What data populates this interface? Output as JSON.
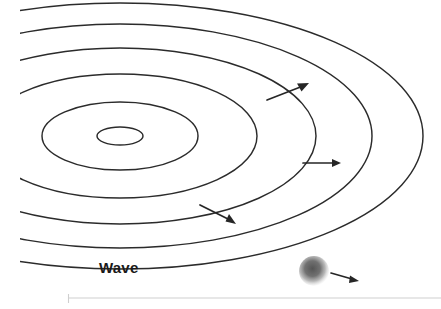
{
  "figure": {
    "background_color": "#ffffff",
    "width": 441,
    "height": 309
  },
  "labels": {
    "wave": "Wave"
  },
  "colors": {
    "stroke": "#2b2b2b",
    "arrow": "#262626",
    "ball_core": "#4a4a4a",
    "ball_edge": "#ffffff",
    "baseline": "#cfcfcf"
  },
  "diagram_data": {
    "type": "diagram",
    "center": {
      "x": 120,
      "y": 136
    },
    "rings": [
      {
        "rx": 23,
        "ry": 9
      },
      {
        "rx": 78,
        "ry": 34
      },
      {
        "rx": 137,
        "ry": 62
      },
      {
        "rx": 196,
        "ry": 88
      },
      {
        "rx": 252,
        "ry": 112
      },
      {
        "rx": 303,
        "ry": 133
      }
    ],
    "ring_count": 6,
    "arrows": [
      {
        "name": "upper-right-arrow",
        "from": {
          "x": 267,
          "y": 100
        },
        "to": {
          "x": 308,
          "y": 84
        }
      },
      {
        "name": "middle-right-arrow",
        "from": {
          "x": 303,
          "y": 163
        },
        "to": {
          "x": 340,
          "y": 163
        }
      },
      {
        "name": "lower-left-arrow",
        "from": {
          "x": 200,
          "y": 205
        },
        "to": {
          "x": 234,
          "y": 223
        }
      },
      {
        "name": "ball-motion-arrow",
        "from": {
          "x": 331,
          "y": 274
        },
        "to": {
          "x": 358,
          "y": 281
        }
      }
    ],
    "source_ball": {
      "cx": 314,
      "cy": 271,
      "r": 14
    },
    "baseline": {
      "x1": 68,
      "y1": 298,
      "x2": 441,
      "y2": 298
    }
  }
}
